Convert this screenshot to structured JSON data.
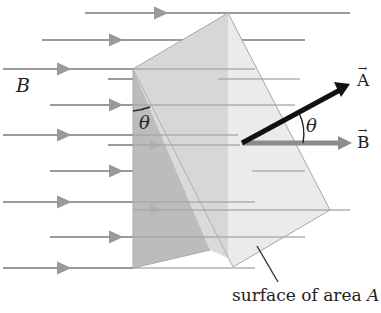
{
  "labels": {
    "field": "B",
    "theta_left": "θ",
    "theta_right": "θ",
    "vector_a": "A",
    "vector_b": "B",
    "vector_arrow": "→",
    "surface_caption_prefix": "surface of area ",
    "surface_caption_var": "A"
  },
  "colors": {
    "field_line": "#9a9a9a",
    "surface_dark": "#b9b9b9",
    "surface_mid": "#d2d2d2",
    "surface_light": "#e6e6e6",
    "vector_a": "#111111",
    "vector_b": "#8c8c8c"
  }
}
